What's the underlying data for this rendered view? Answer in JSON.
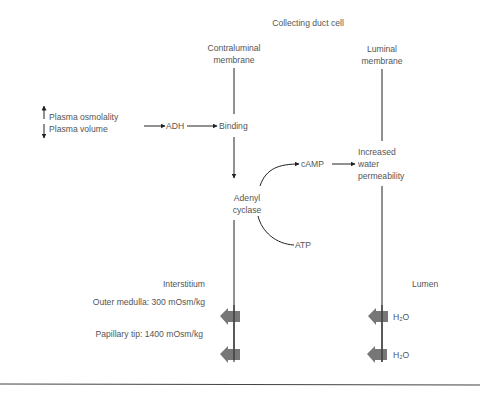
{
  "diagram": {
    "title": "Collecting duct cell",
    "contraluminal": {
      "line1": "Contraluminal",
      "line2": "membrane"
    },
    "luminal": {
      "line1": "Luminal",
      "line2": "membrane"
    },
    "stimuli": {
      "osmolality": "Plasma osmolality",
      "volume": "Plasma volume"
    },
    "adh": "ADH",
    "binding": "Binding",
    "adenyl": {
      "line1": "Adenyl",
      "line2": "cyclase"
    },
    "camp": "cAMP",
    "atp": "ATP",
    "permeability": {
      "line1": "Increased",
      "line2": "water",
      "line3": "permeability"
    },
    "interstitium": "Interstitium",
    "outer_medulla": "Outer medulla: 300 mOsm/kg",
    "papillary_tip": "Papillary tip: 1400 mOsm/kg",
    "lumen": "Lumen",
    "water_1": "H₂O",
    "water_2": "H₂O"
  },
  "colors": {
    "text": "#555555",
    "line": "#222222",
    "block_arrow": "#777777"
  }
}
